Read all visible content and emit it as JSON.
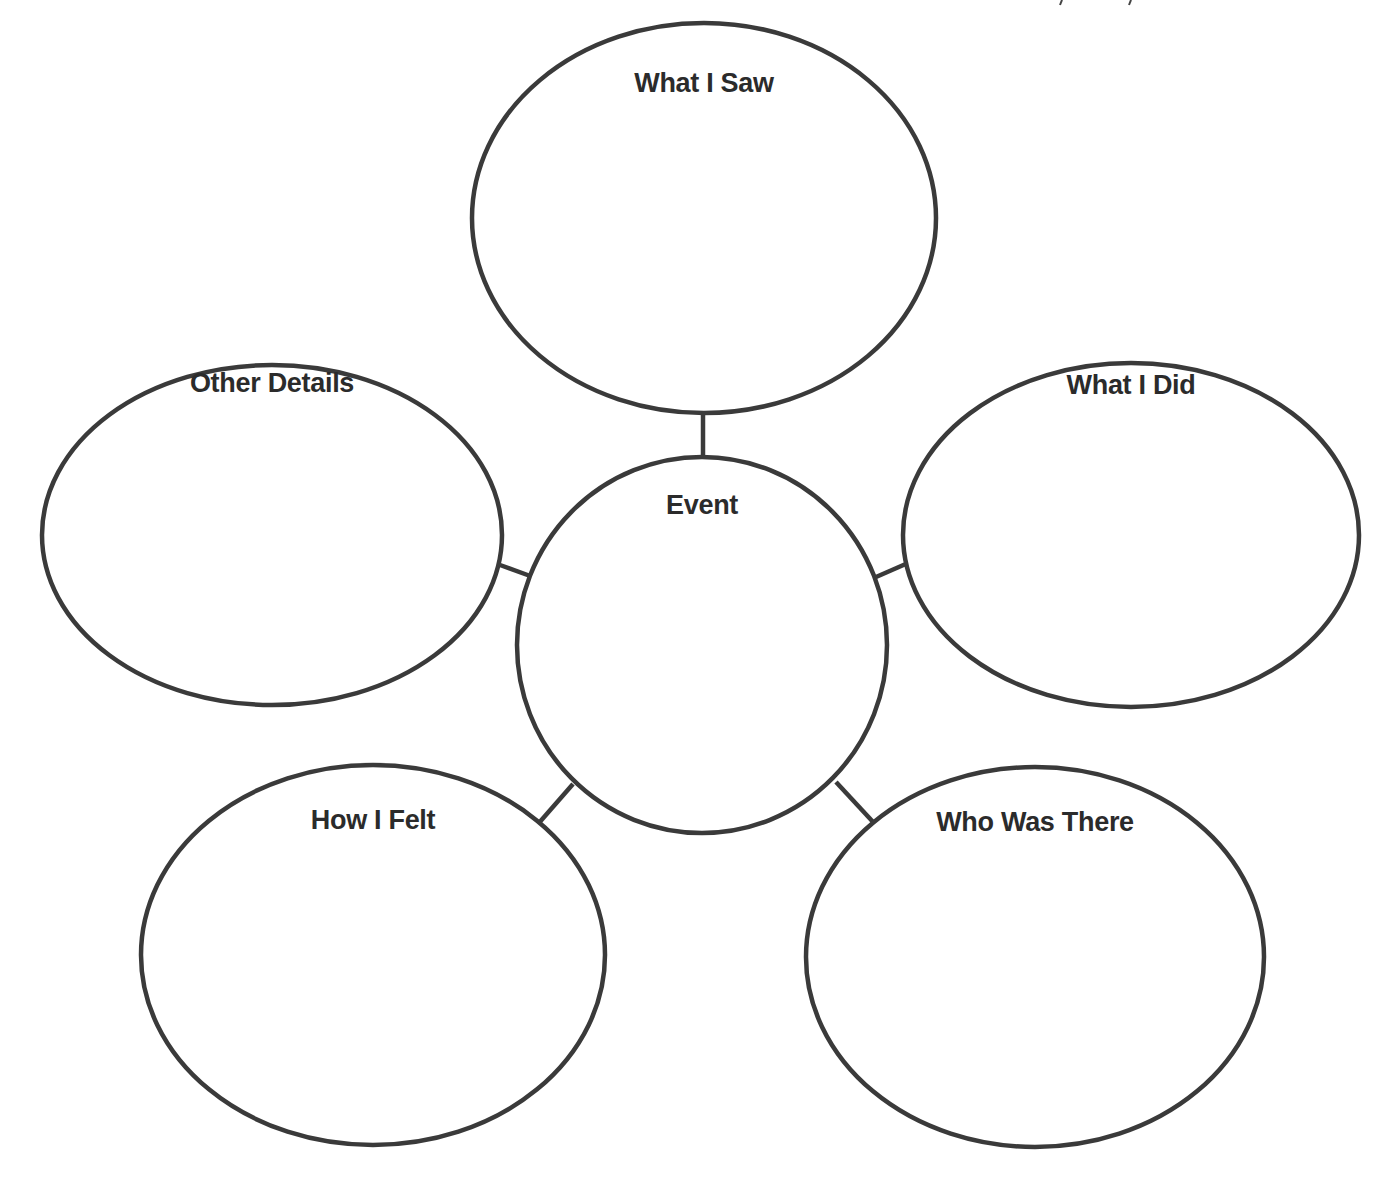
{
  "diagram": {
    "type": "web graphic organizer",
    "stroke_color": "#3a3a3a",
    "text_color": "#2b2b2b",
    "background": "#ffffff",
    "center": {
      "label": "Event",
      "cx": 702,
      "cy": 645,
      "rx": 185,
      "ry": 188,
      "label_y": 507
    },
    "bubbles": [
      {
        "id": "what-i-saw",
        "label": "What I Saw",
        "cx": 704,
        "cy": 218,
        "rx": 232,
        "ry": 195,
        "label_y": 85
      },
      {
        "id": "other-details",
        "label": "Other Details",
        "cx": 272,
        "cy": 535,
        "rx": 230,
        "ry": 170,
        "label_y": 385
      },
      {
        "id": "what-i-did",
        "label": "What I Did",
        "cx": 1131,
        "cy": 535,
        "rx": 228,
        "ry": 172,
        "label_y": 387
      },
      {
        "id": "how-i-felt",
        "label": "How I Felt",
        "cx": 373,
        "cy": 955,
        "rx": 232,
        "ry": 190,
        "label_y": 822
      },
      {
        "id": "who-was-there",
        "label": "Who Was There",
        "cx": 1035,
        "cy": 957,
        "rx": 229,
        "ry": 190,
        "label_y": 824
      }
    ],
    "connectors": [
      {
        "to": "what-i-saw",
        "x1": 703,
        "y1": 412,
        "x2": 703,
        "y2": 458
      },
      {
        "to": "other-details",
        "x1": 500,
        "y1": 565,
        "x2": 533,
        "y2": 577
      },
      {
        "to": "what-i-did",
        "x1": 876,
        "y1": 577,
        "x2": 908,
        "y2": 563
      },
      {
        "to": "how-i-felt",
        "x1": 573,
        "y1": 784,
        "x2": 538,
        "y2": 824
      },
      {
        "to": "who-was-there",
        "x1": 836,
        "y1": 782,
        "x2": 874,
        "y2": 823
      }
    ]
  }
}
